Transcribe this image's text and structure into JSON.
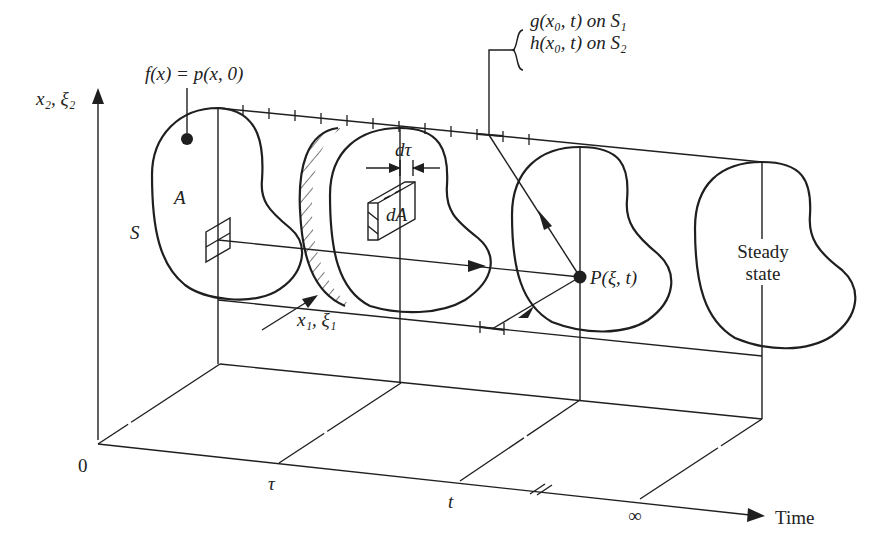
{
  "diagram": {
    "axes": {
      "vertical_label": "x₂, ξ₂",
      "depth_label": "x₁, ξ₁",
      "time_label": "Time",
      "origin_label": "0",
      "time_ticks": [
        "τ",
        "t",
        "∞"
      ]
    },
    "labels": {
      "initial_condition": "f(x) = p(x, 0)",
      "region": "A",
      "boundary": "S",
      "boundary_conditions": [
        "g(x₀, t) on S₁",
        "h(x₀, t) on S₂"
      ],
      "time_increment": "dτ",
      "area_element": "dA",
      "field_point": "P(ξ, t)",
      "steady_state": "Steady state"
    },
    "cross_sections": [
      {
        "name": "initial",
        "time": "0"
      },
      {
        "name": "source-slab",
        "time": "τ"
      },
      {
        "name": "observation",
        "time": "t"
      },
      {
        "name": "steady-state",
        "time": "∞"
      }
    ],
    "colors": {
      "ink": "#1f1f1f",
      "background": "#ffffff"
    }
  }
}
